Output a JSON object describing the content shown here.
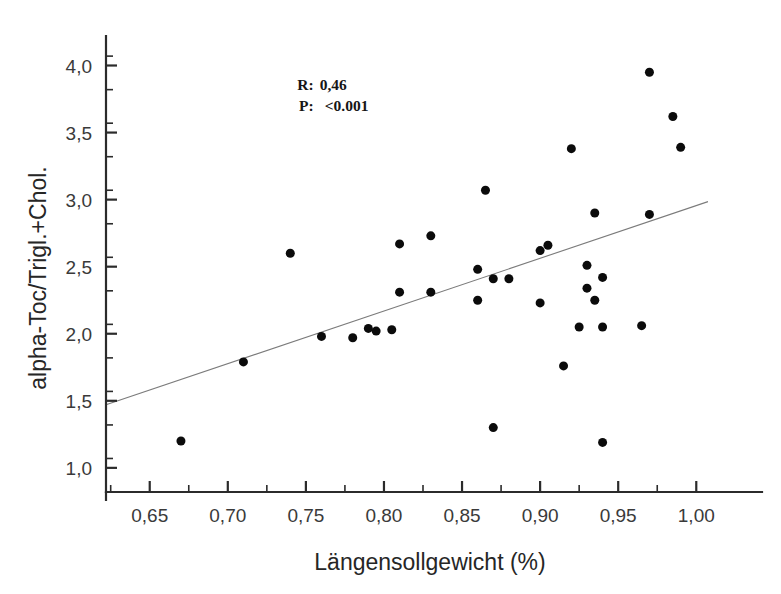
{
  "chart_data": {
    "type": "scatter",
    "title": "",
    "xlabel": "Längensollgewicht (%)",
    "ylabel": "alpha-Toc/Trigl.+Chol.",
    "xlim": [
      0.622,
      1.028
    ],
    "ylim": [
      0.82,
      4.22
    ],
    "x_ticks": [
      0.65,
      0.7,
      0.75,
      0.8,
      0.85,
      0.9,
      0.95,
      1.0
    ],
    "x_ticklabels": [
      "0,65",
      "0,70",
      "0,75",
      "0,80",
      "0,85",
      "0,90",
      "0,95",
      "1,00"
    ],
    "x_minor_step": 0.025,
    "y_ticks": [
      1.0,
      1.5,
      2.0,
      2.5,
      3.0,
      3.5,
      4.0
    ],
    "y_ticklabels": [
      "1,0",
      "1,5",
      "2,0",
      "2,5",
      "3,0",
      "3,5",
      "4,0"
    ],
    "y_minor_step": 0.25,
    "grid": false,
    "legend": false,
    "marker": "filled-circle",
    "marker_color": "#0b0b0b",
    "marker_size": 9,
    "fitline": {
      "color": "#7b7b7b",
      "x_start": 0.622,
      "y_start": 1.47,
      "x_end": 1.0075,
      "y_end": 2.985
    },
    "x": [
      0.67,
      0.71,
      0.74,
      0.76,
      0.78,
      0.79,
      0.795,
      0.805,
      0.81,
      0.81,
      0.83,
      0.83,
      0.86,
      0.86,
      0.865,
      0.87,
      0.87,
      0.88,
      0.9,
      0.9,
      0.905,
      0.915,
      0.92,
      0.925,
      0.93,
      0.93,
      0.935,
      0.935,
      0.94,
      0.94,
      0.94,
      0.965,
      0.97,
      0.97,
      0.985,
      0.99
    ],
    "y": [
      1.2,
      1.79,
      2.6,
      1.98,
      1.97,
      2.04,
      2.02,
      2.03,
      2.67,
      2.31,
      2.73,
      2.31,
      2.48,
      2.25,
      3.07,
      2.41,
      1.3,
      2.41,
      2.62,
      2.23,
      2.66,
      1.76,
      3.38,
      2.05,
      2.34,
      2.51,
      2.25,
      2.9,
      2.42,
      1.19,
      2.05,
      2.06,
      3.95,
      2.89,
      3.62,
      3.39
    ],
    "n_points": 36,
    "annotations": [
      {
        "id": "r-stat",
        "label": "R:",
        "value": "0,46",
        "x": 0.755,
        "y": 3.82
      },
      {
        "id": "p-stat",
        "label": "P:",
        "value": "<0.001",
        "x": 0.755,
        "y": 3.66
      }
    ]
  }
}
